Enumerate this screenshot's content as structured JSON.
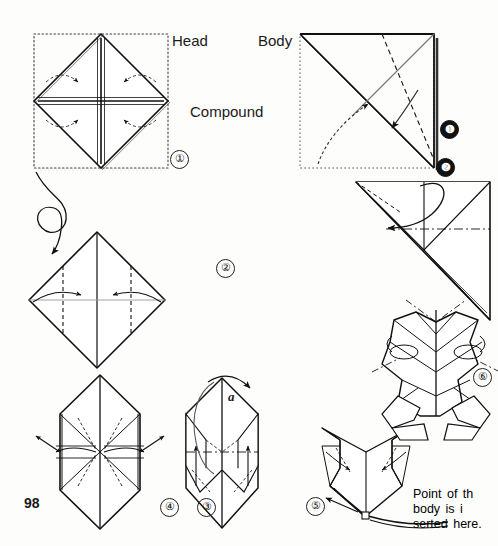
{
  "page": {
    "number": "98",
    "background": "#fdfdfc",
    "ink": "#111111",
    "width": 498,
    "height": 546
  },
  "labels": {
    "head": "Head",
    "body": "Body",
    "compound": "Compound",
    "point_marker_a": "a"
  },
  "note": {
    "line1": "Point    of  th",
    "line2": "body    is    i",
    "line3": "serted here."
  },
  "steps": [
    {
      "id": "step-1",
      "marker": "①",
      "style": "outline",
      "section": "head",
      "caption": "Diamond base with cross creases; four corners folded inward"
    },
    {
      "id": "step-2",
      "marker": "②",
      "style": "outline",
      "section": "head",
      "caption": "Side flaps folded to the center along vertical dashed creases"
    },
    {
      "id": "step-3",
      "marker": "③",
      "style": "outline",
      "section": "head",
      "caption": "Hexagonal form, inner flaps pulled outward"
    },
    {
      "id": "step-4",
      "marker": "④",
      "style": "outline",
      "section": "head",
      "caption": "Ears shaped, flaps lifted upward"
    },
    {
      "id": "step-5",
      "marker": "⑤",
      "style": "outline",
      "section": "head",
      "caption": "Finished head; body point inserted at the base"
    },
    {
      "id": "step-6",
      "marker": "⑥",
      "style": "outline",
      "section": "compound",
      "caption": "Completed compound figure"
    },
    {
      "id": "body-step-1",
      "marker": "❶",
      "style": "filled",
      "section": "body",
      "caption": "Square sheet, diagonal valley and mountain creases"
    },
    {
      "id": "body-step-2",
      "marker": "❷",
      "style": "filled",
      "section": "body",
      "caption": "Folded triangle with corner petal folded down"
    }
  ]
}
